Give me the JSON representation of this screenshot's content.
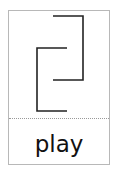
{
  "card": {
    "word": "play",
    "symbol": "play-glyph",
    "line_color": "#222222",
    "border_color": "#b8b8b8"
  }
}
